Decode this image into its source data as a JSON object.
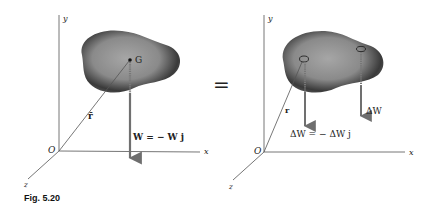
{
  "figure": {
    "caption": "Fig. 5.20",
    "equals_sign": "="
  },
  "left_diagram": {
    "axes": {
      "y": "y",
      "x": "x",
      "z": "z",
      "origin": "O"
    },
    "center_of_gravity_label": "G",
    "position_vector_label": "r̄",
    "weight_label": "W = − W j"
  },
  "right_diagram": {
    "axes": {
      "y": "y",
      "x": "x",
      "z": "z",
      "origin": "O"
    },
    "position_vector_label": "r",
    "element_weight_label": "ΔW",
    "element_weight_eq_label": "ΔW = − ΔW j"
  },
  "colors": {
    "axis": "#555555",
    "arrow": "#707070",
    "blob_dark": "#2e2e2e",
    "blob_light": "#9a9a9a"
  }
}
